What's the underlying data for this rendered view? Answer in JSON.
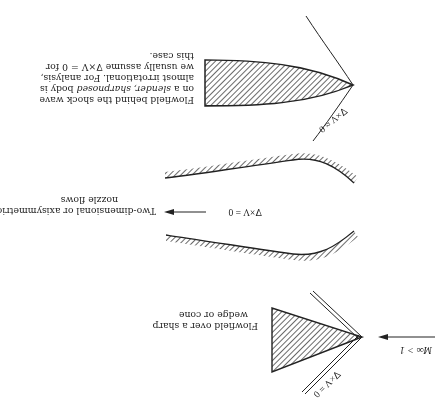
{
  "figure": {
    "orientation": "rotated-180",
    "ink_color": "#222222",
    "hatch_color": "#444444",
    "panels": [
      {
        "id": "wedge",
        "caption_line1": "Flowfield over a sharp",
        "caption_line2": "wedge or cone",
        "equation": "∇×V = 0",
        "freestream_label": "M∞ > 1"
      },
      {
        "id": "nozzle",
        "caption_line1": "Two-dimensional or axisymmetric",
        "caption_line2": "nozzle flows",
        "equation": "∇×V = 0"
      },
      {
        "id": "slender-body",
        "caption_line1": "Flowfield behind the shock wave",
        "caption_line2_pre": "on a ",
        "caption_line2_it": "slender, sharpnosed",
        "caption_line2_post": " body is",
        "caption_line3": "almost irrotational. For analysis,",
        "caption_line4": "we usually assume ∇×V = 0 for",
        "caption_line5": "this case.",
        "equation": "∇×V ≈ 0"
      }
    ]
  }
}
